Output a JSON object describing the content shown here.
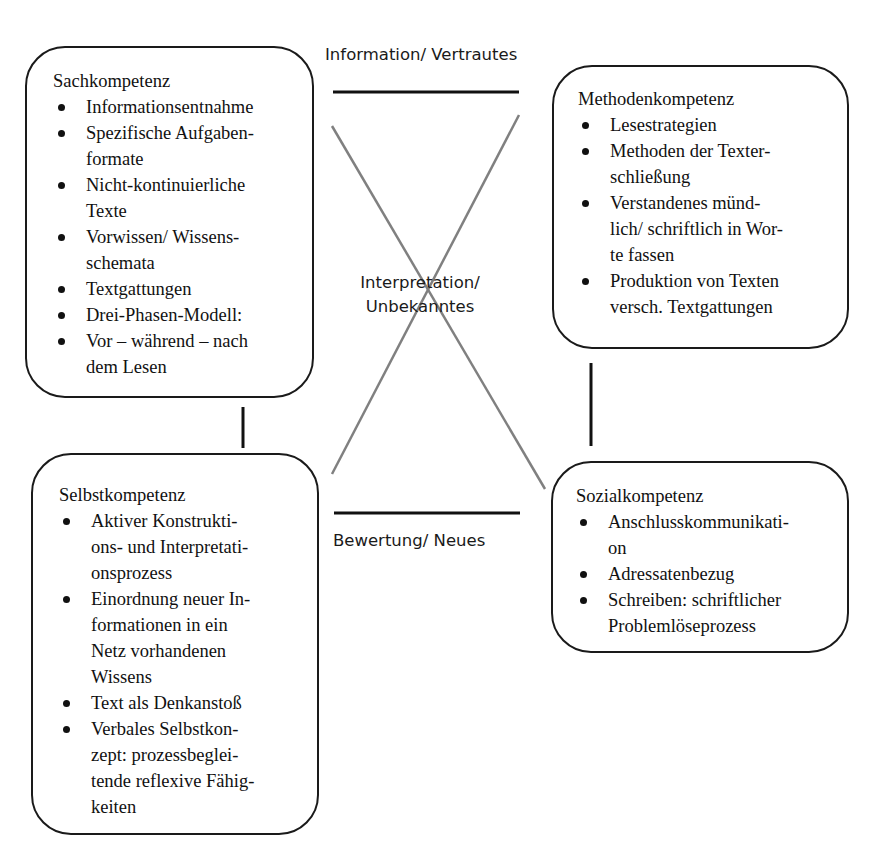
{
  "axis_labels": {
    "top": "Information/ Vertrautes",
    "center_line1": "Interpretation/",
    "center_line2": "Unbekanntes",
    "bottom": "Bewertung/ Neues"
  },
  "boxes": {
    "sachkompetenz": {
      "title": "Sachkompetenz",
      "items": [
        "Informationsentnahme",
        "Spezifische Aufgaben-\nformate",
        "Nicht-kontinuierliche\nTexte",
        "Vorwissen/ Wissens-\nschemata",
        "Textgattungen",
        "Drei-Phasen-Modell:",
        "Vor – während – nach\ndem Lesen"
      ]
    },
    "methodenkompetenz": {
      "title": "Methodenkompetenz",
      "items": [
        "Lesestrategien",
        "Methoden der Texter-\nschließung",
        "Verstandenes münd-\nlich/ schriftlich in Wor-\nte fassen",
        "Produktion von Texten\nversch. Textgattungen"
      ]
    },
    "selbstkompetenz": {
      "title": "Selbstkompetenz",
      "items": [
        "Aktiver Konstrukti-\nons- und Interpretati-\nonsprozess",
        "Einordnung neuer In-\nformationen in ein\nNetz vorhandenen\nWissens",
        "Text als Denkanstoß",
        "Verbales Selbstkon-\nzept: prozessbeglei-\ntende reflexive Fähig-\nkeiten"
      ]
    },
    "sozialkompetenz": {
      "title": "Sozialkompetenz",
      "items": [
        "Anschlusskommunikati-\non",
        "Adressatenbezug",
        "Schreiben: schriftlicher\nProblemlöseprozess"
      ]
    }
  },
  "colors": {
    "box_border": "#1a1a1a",
    "solid_lines": "#111111",
    "cross_lines": "#808080",
    "background": "#ffffff"
  }
}
